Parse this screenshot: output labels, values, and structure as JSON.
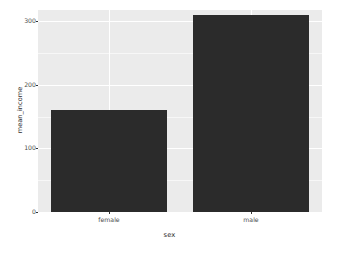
{
  "chart_data": {
    "type": "bar",
    "title": "",
    "subtitle": "",
    "xlabel": "sex",
    "ylabel": "mean_income",
    "categories": [
      "female",
      "male"
    ],
    "values": [
      160,
      310
    ],
    "series": [
      {
        "name": "mean_income",
        "values": [
          160,
          310
        ]
      }
    ],
    "ylim": [
      0,
      318
    ],
    "xlim_categories": [
      "female",
      "male"
    ],
    "y_ticks": [
      0,
      100,
      200,
      300
    ],
    "y_tick_labels": [
      "0",
      "100",
      "200",
      "300"
    ],
    "y_minor_ticks": [
      50,
      150,
      250
    ],
    "grid": true,
    "grid_color": "#ffffff",
    "minor_grid_color": "#f7f7f7",
    "panel_background": "#ebebeb",
    "plot_background": "#ffffff",
    "bar_color": "#2b2b2b",
    "legend": false,
    "legend_position": "none",
    "axis_text_color": "#4d4d4d",
    "axis_title_color": "#2b2b2b"
  },
  "axes": {
    "y": {
      "title": "mean_income",
      "ticks": [
        {
          "label": "300",
          "value": 300
        },
        {
          "label": "200",
          "value": 200
        },
        {
          "label": "100",
          "value": 100
        },
        {
          "label": "0",
          "value": 0
        }
      ]
    },
    "x": {
      "title": "sex",
      "ticks": [
        {
          "label": "female"
        },
        {
          "label": "male"
        }
      ]
    }
  },
  "bars": [
    {
      "category": "female",
      "value": 160
    },
    {
      "category": "male",
      "value": 310
    }
  ]
}
